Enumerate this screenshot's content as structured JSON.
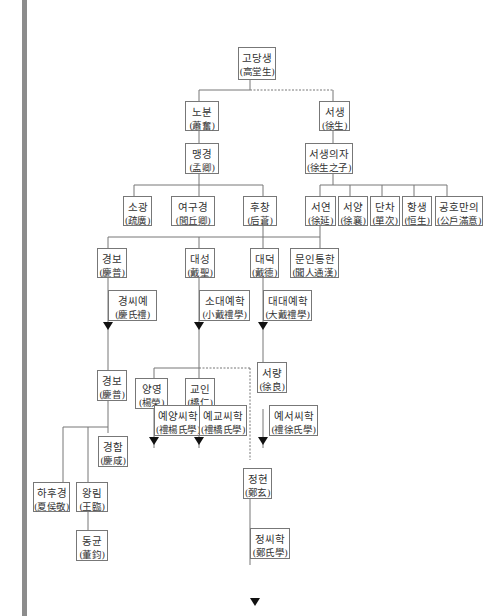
{
  "diagram": {
    "nodes": {
      "gaodangsheng": {
        "ko": "고당생",
        "hanja": "(高堂生)"
      },
      "houcang_root": {
        "ko": "노분",
        "hanja": "(蕭奮)"
      },
      "xusheng": {
        "ko": "서생",
        "hanja": "(徐生)"
      },
      "mengqing": {
        "ko": "맹경",
        "hanja": "(孟卿)"
      },
      "xusheng_zi": {
        "ko": "서생의자",
        "hanja": "(徐生之子)"
      },
      "shuguang": {
        "ko": "소광",
        "hanja": "(疏廣)"
      },
      "lvqiuqing": {
        "ko": "여구경",
        "hanja": "(閭丘卿)"
      },
      "houcang": {
        "ko": "후창",
        "hanja": "(后蒼)"
      },
      "xuyan": {
        "ko": "서연",
        "hanja": "(徐延)"
      },
      "xuxiang": {
        "ko": "서양",
        "hanja": "(徐襄)"
      },
      "danci": {
        "ko": "단차",
        "hanja": "(單次)"
      },
      "hengsheng": {
        "ko": "항생",
        "hanja": "(恒生)"
      },
      "gonghu": {
        "ko": "공호만의",
        "hanja": "(公戶滿意)"
      },
      "qingpu1": {
        "ko": "경보",
        "hanja": "(慶普)"
      },
      "daisheng": {
        "ko": "대성",
        "hanja": "(戴聖)"
      },
      "daide": {
        "ko": "대덕",
        "hanja": "(戴德)"
      },
      "wenren": {
        "ko": "문인통한",
        "hanja": "(聞人通漢)"
      },
      "qingshili": {
        "ko": "경씨예",
        "hanja": "(慶氏禮)"
      },
      "xiaodaili": {
        "ko": "소대예학",
        "hanja": "(小戴禮學)"
      },
      "dadaili": {
        "ko": "대대예학",
        "hanja": "(大戴禮學)"
      },
      "qingpu2": {
        "ko": "경보",
        "hanja": "(慶普)"
      },
      "yangrong": {
        "ko": "양영",
        "hanja": "(楊榮)"
      },
      "qiaoren": {
        "ko": "교인",
        "hanja": "(橋仁)"
      },
      "xuliang": {
        "ko": "서량",
        "hanja": "(徐良)"
      },
      "liyang": {
        "ko": "예양씨학",
        "hanja": "(禮楊氏學)"
      },
      "liqiao": {
        "ko": "예교씨학",
        "hanja": "(禮橋氏學)"
      },
      "lixu": {
        "ko": "예서씨학",
        "hanja": "(禮徐氏學)"
      },
      "qingxian": {
        "ko": "경함",
        "hanja": "(慶咸)"
      },
      "xiahoujing": {
        "ko": "하후경",
        "hanja": "(夏侯敬)"
      },
      "wanglin": {
        "ko": "왕림",
        "hanja": "(王臨)"
      },
      "zhengxuan": {
        "ko": "정현",
        "hanja": "(鄭玄)"
      },
      "dongjun": {
        "ko": "동균",
        "hanja": "(董鈞)"
      },
      "zhengshi": {
        "ko": "정씨학",
        "hanja": "(鄭氏學)"
      }
    },
    "colors": {
      "line": "#777777",
      "sidebar": "#8c8c8c",
      "arrow": "#111111"
    }
  }
}
